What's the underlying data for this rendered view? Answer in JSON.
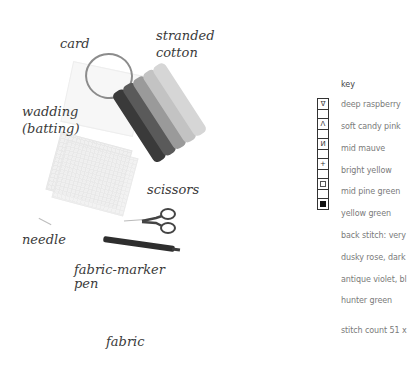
{
  "labels": {
    "card": "card",
    "stranded_line1": "stranded",
    "stranded_line2": "cotton",
    "wadding_line1": "wadding",
    "wadding_line2": "(batting)",
    "scissors": "scissors",
    "needle": "needle",
    "marker_line1": "fabric-marker",
    "marker_line2": "pen",
    "fabric": "fabric"
  },
  "key": {
    "title": "key",
    "symbols": [
      {
        "symbol": "∇",
        "label": "deep raspberry"
      },
      {
        "symbol": "Λ",
        "label": "soft candy pink"
      },
      {
        "symbol": "И",
        "label": "mid mauve"
      },
      {
        "symbol": "+",
        "label": "bright yellow"
      },
      {
        "symbol": "box",
        "label": "mid pine green"
      },
      {
        "symbol": "filled-square",
        "label": "yellow green"
      }
    ],
    "backstitch": [
      "back stitch: very",
      "dusky rose, dark",
      "antique violet, bl",
      "hunter green"
    ],
    "stitch_count": "stitch count 51 x"
  }
}
